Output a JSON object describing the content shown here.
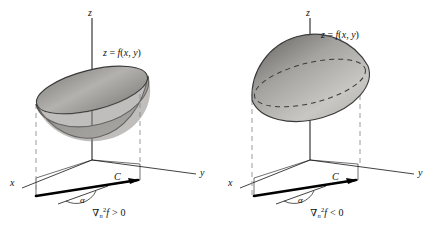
{
  "figure": {
    "background": "#ffffff",
    "ink": "#111111",
    "dash_color": "#9a9a9a",
    "surface_light": "#d8d6d2",
    "surface_mid": "#b0aeaa",
    "surface_dark": "#6e6c69",
    "rim_color": "#3a3a3a"
  },
  "panels": [
    {
      "id": "left",
      "surface_kind": "concave-bowl",
      "axes": {
        "x": "x",
        "y": "y",
        "z": "z"
      },
      "surface_label": "z = f(x, y)",
      "curve_label": "C",
      "angle_label": "α",
      "caption": {
        "nabla": "∇",
        "subscript": "n",
        "superscript": "2",
        "function": "f",
        "relation": "> 0",
        "full": "∇ₙ²f > 0"
      }
    },
    {
      "id": "right",
      "surface_kind": "convex-dome",
      "axes": {
        "x": "x",
        "y": "y",
        "z": "z"
      },
      "surface_label": "z = f(x, y)",
      "curve_label": "C",
      "angle_label": "α",
      "caption": {
        "nabla": "∇",
        "subscript": "n",
        "superscript": "2",
        "function": "f",
        "relation": "< 0",
        "full": "∇ₙ²f < 0"
      }
    }
  ]
}
